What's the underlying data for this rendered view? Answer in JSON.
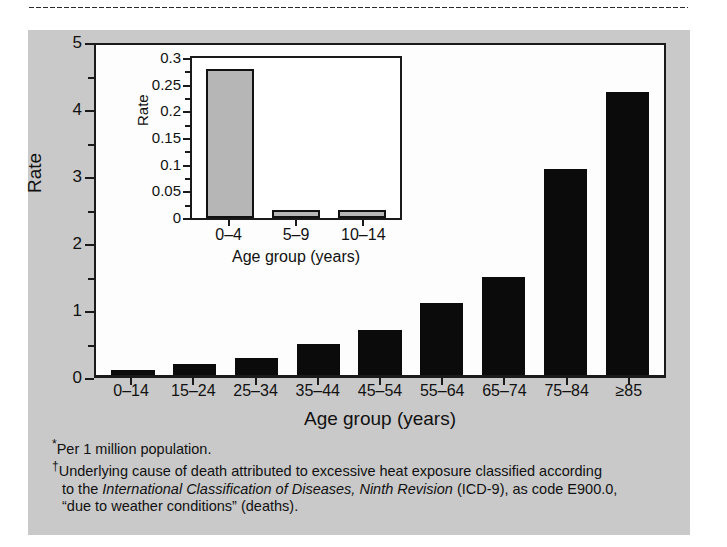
{
  "figure": {
    "background_color": "#c9c9c9",
    "bar_color": "#0b0b0b",
    "inset_bar_color": "#b6b6b6"
  },
  "chart_data": {
    "type": "bar",
    "title": "",
    "xlabel": "Age group (years)",
    "ylabel": "Rate",
    "ylim": [
      0,
      5
    ],
    "yticks": [
      "0",
      "1",
      "2",
      "3",
      "4",
      "5"
    ],
    "ytick_values": [
      0,
      1,
      2,
      3,
      4,
      5
    ],
    "grid": false,
    "legend": "none",
    "categories": [
      "0–14",
      "15–24",
      "25–34",
      "35–44",
      "45–54",
      "55–64",
      "65–74",
      "75–84",
      "≥85"
    ],
    "values": [
      0.07,
      0.17,
      0.25,
      0.47,
      0.67,
      1.08,
      1.46,
      3.07,
      4.22
    ],
    "inset": {
      "type": "bar",
      "xlabel": "Age group (years)",
      "ylabel": "Rate",
      "ylim": [
        0,
        0.3
      ],
      "yticks": [
        "0",
        "0.05",
        "0.1",
        "0.15",
        "0.2",
        "0.25",
        "0.3"
      ],
      "ytick_values": [
        0,
        0.05,
        0.1,
        0.15,
        0.2,
        0.25,
        0.3
      ],
      "grid": false,
      "categories": [
        "0–4",
        "5–9",
        "10–14"
      ],
      "values": [
        0.28,
        0.015,
        0.015
      ]
    }
  },
  "footnotes": {
    "line1_mark": "*",
    "line1_text": "Per 1 million population.",
    "line2_mark": "†",
    "line2_text": "Underlying cause of death attributed to excessive heat exposure classified according",
    "line3_prefix": "to the ",
    "line3_italic": "International Classification of Diseases, Ninth Revision",
    "line3_suffix": " (ICD-9), as code E900.0,",
    "line4_text": "“due to weather conditions” (deaths)."
  }
}
